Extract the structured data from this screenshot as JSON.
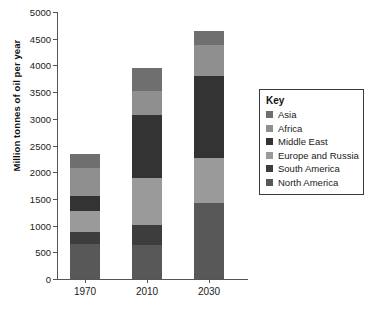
{
  "top_clipped_text": "",
  "axes": {
    "ylabel": "Million tonnes of oil per year",
    "yticks": [
      0,
      500,
      1000,
      1500,
      2000,
      2500,
      3000,
      3500,
      4000,
      4500,
      5000
    ],
    "ylim": [
      0,
      5000
    ],
    "categories": [
      "1970",
      "2010",
      "2030"
    ]
  },
  "legend": {
    "title": "Key",
    "items": [
      {
        "label": "Asia",
        "color": "#6f6f6f"
      },
      {
        "label": "Africa",
        "color": "#8f8f8f"
      },
      {
        "label": "Middle East",
        "color": "#333333"
      },
      {
        "label": "Europe and Russia",
        "color": "#9a9a9a"
      },
      {
        "label": "South America",
        "color": "#3d3d3d"
      },
      {
        "label": "North America",
        "color": "#585858"
      }
    ]
  },
  "chart_data": {
    "type": "bar",
    "stacked": true,
    "title": "",
    "xlabel": "",
    "ylabel": "Million tonnes of oil per year",
    "ylim": [
      0,
      5000
    ],
    "ytick_step": 500,
    "grid": false,
    "legend_position": "right",
    "categories": [
      "1970",
      "2010",
      "2030"
    ],
    "series": [
      {
        "name": "North America",
        "color": "#585858",
        "values": [
          650,
          640,
          1430
        ]
      },
      {
        "name": "South America",
        "color": "#3d3d3d",
        "values": [
          230,
          380,
          0
        ]
      },
      {
        "name": "Europe and Russia",
        "color": "#9a9a9a",
        "values": [
          400,
          870,
          830
        ]
      },
      {
        "name": "Middle East",
        "color": "#333333",
        "values": [
          270,
          1180,
          1550
        ]
      },
      {
        "name": "Africa",
        "color": "#8f8f8f",
        "values": [
          530,
          450,
          580
        ]
      },
      {
        "name": "Asia",
        "color": "#6f6f6f",
        "values": [
          270,
          430,
          250
        ]
      }
    ],
    "totals": [
      2350,
      3950,
      4640
    ]
  }
}
